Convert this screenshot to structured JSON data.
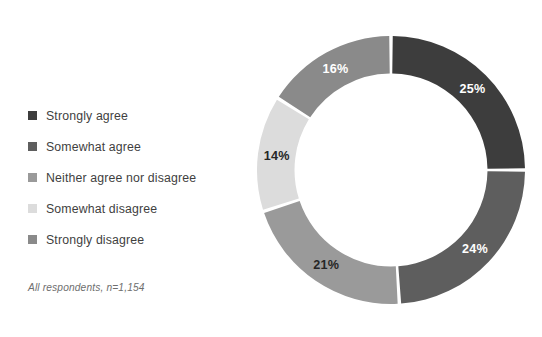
{
  "title_remnant": "",
  "legend": {
    "items": [
      {
        "label": "Strongly agree",
        "color": "#3d3d3d"
      },
      {
        "label": "Somewhat agree",
        "color": "#5e5e5e"
      },
      {
        "label": "Neither agree nor disagree",
        "color": "#9a9a9a"
      },
      {
        "label": "Somewhat disagree",
        "color": "#dcdcdc"
      },
      {
        "label": "Strongly disagree",
        "color": "#8a8a8a"
      }
    ]
  },
  "footnote": "All respondents, n=1,154",
  "chart_data": {
    "type": "pie",
    "variant": "donut",
    "title": "",
    "xlabel": "",
    "ylabel": "",
    "start_angle_deg": 0,
    "direction": "clockwise",
    "inner_radius_ratio": 0.72,
    "legend_position": "left",
    "grid": false,
    "value_unit": "%",
    "total": 100,
    "sample_size": "n=1,154",
    "categories": [
      "Strongly agree",
      "Somewhat agree",
      "Neither agree nor disagree",
      "Somewhat disagree",
      "Strongly disagree"
    ],
    "values": [
      25,
      24,
      21,
      14,
      16
    ],
    "labels": [
      "25%",
      "24%",
      "21%",
      "14%",
      "16%"
    ],
    "colors": [
      "#3d3d3d",
      "#5e5e5e",
      "#9a9a9a",
      "#dcdcdc",
      "#8a8a8a"
    ],
    "label_colors": [
      "#ffffff",
      "#ffffff",
      "#262626",
      "#262626",
      "#ffffff"
    ],
    "slices": [
      {
        "category": "Strongly agree",
        "value": 25,
        "label": "25%",
        "color": "#3d3d3d",
        "label_color": "#ffffff"
      },
      {
        "category": "Somewhat agree",
        "value": 24,
        "label": "24%",
        "color": "#5e5e5e",
        "label_color": "#ffffff"
      },
      {
        "category": "Neither agree nor disagree",
        "value": 21,
        "label": "21%",
        "color": "#9a9a9a",
        "label_color": "#262626"
      },
      {
        "category": "Somewhat disagree",
        "value": 14,
        "label": "14%",
        "color": "#dcdcdc",
        "label_color": "#262626"
      },
      {
        "category": "Strongly disagree",
        "value": 16,
        "label": "16%",
        "color": "#8a8a8a",
        "label_color": "#ffffff"
      }
    ]
  }
}
